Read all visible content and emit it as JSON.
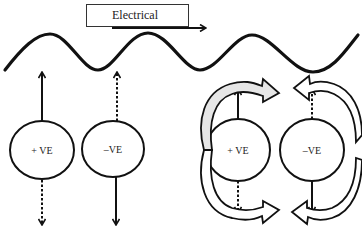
{
  "title": {
    "label": "Electrical"
  },
  "charges": [
    {
      "id": "left-positive",
      "label": "+ VE",
      "cx": 42,
      "cy": 150
    },
    {
      "id": "left-negative",
      "label": "–VE",
      "cx": 113,
      "cy": 149
    },
    {
      "id": "right-positive",
      "label": "+ VE",
      "cx": 238,
      "cy": 150
    },
    {
      "id": "right-negative",
      "label": "–VE",
      "cx": 312,
      "cy": 150
    }
  ],
  "colors": {
    "stroke": "#111111",
    "fill_light": "#e6e6e6",
    "background": "#ffffff"
  }
}
